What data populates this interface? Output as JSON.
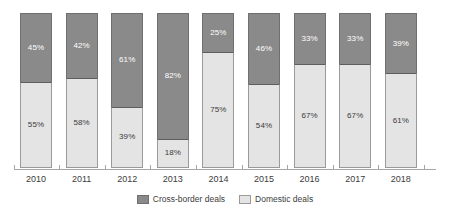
{
  "chart_data": {
    "type": "bar",
    "subtype": "stacked-100-percent",
    "title": "",
    "xlabel": "",
    "ylabel": "",
    "ylim": [
      0,
      100
    ],
    "grid": false,
    "legend_position": "bottom-center",
    "categories": [
      "2010",
      "2011",
      "2012",
      "2013",
      "2014",
      "2015",
      "2016",
      "2017",
      "2018"
    ],
    "series": [
      {
        "name": "Cross-border deals",
        "color": "#8a8a8a",
        "values": [
          45,
          42,
          61,
          82,
          25,
          46,
          33,
          33,
          39
        ],
        "labels": [
          "45%",
          "42%",
          "61%",
          "82%",
          "25%",
          "46%",
          "33%",
          "33%",
          "39%"
        ]
      },
      {
        "name": "Domestic deals",
        "color": "#e4e4e4",
        "values": [
          55,
          58,
          39,
          18,
          75,
          54,
          67,
          67,
          61
        ],
        "labels": [
          "55%",
          "58%",
          "39%",
          "18%",
          "75%",
          "54%",
          "67%",
          "67%",
          "61%"
        ]
      }
    ]
  },
  "legend": {
    "items": [
      {
        "label": "Cross-border deals",
        "swatch": "cross"
      },
      {
        "label": "Domestic deals",
        "swatch": "domestic"
      }
    ]
  }
}
